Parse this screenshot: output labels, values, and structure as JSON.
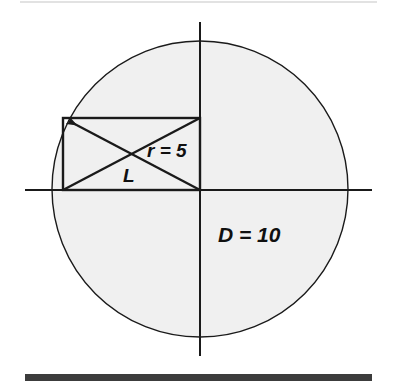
{
  "figure": {
    "type": "geometry-diagram",
    "canvas": {
      "width": 397,
      "height": 392,
      "background": "#ffffff"
    },
    "colors": {
      "circle_fill": "#f0f0f0",
      "stroke": "#1a1a1a",
      "axis": "#1a1a1a",
      "top_rule": "#e2e2e2",
      "bottom_bar": "#3c3c3c",
      "label": "#101010"
    },
    "circle": {
      "name": "main-circle",
      "center_x": 200,
      "center_y": 189,
      "radius": 148,
      "fill": "#f0f0f0",
      "stroke_width": 1.4
    },
    "axes": {
      "horizontal": {
        "y": 190,
        "x_start": 25,
        "x_end": 372,
        "stroke_width": 2
      },
      "vertical": {
        "x": 200,
        "y_start": 22,
        "y_end": 356,
        "stroke_width": 2
      }
    },
    "rectangle": {
      "name": "inscribed-rectangle",
      "left": 63,
      "top": 118,
      "right": 200,
      "bottom": 190,
      "width": 137,
      "height": 72,
      "stroke_width": 2.4
    },
    "diagonals": [
      {
        "name": "diagonal-radius",
        "from_x": 63,
        "from_y": 190,
        "to_x": 200,
        "to_y": 118,
        "arrow": false,
        "stroke_width": 2.4
      },
      {
        "name": "diagonal-arrow",
        "from_x": 200,
        "from_y": 190,
        "to_x": 63,
        "to_y": 118,
        "arrow": true,
        "stroke_width": 2.4
      }
    ],
    "labels": [
      {
        "id": "radius-label",
        "text": "r = 5",
        "x": 147,
        "y": 157
      },
      {
        "id": "length-label",
        "text": "L",
        "x": 123,
        "y": 182
      },
      {
        "id": "diameter-label",
        "text": "D = 10",
        "x": 218,
        "y": 242
      }
    ],
    "rules": {
      "top_rule": {
        "y": 2,
        "x_start": 20,
        "x_end": 377,
        "thickness": 2
      },
      "bottom_bar": {
        "y": 374,
        "x_start": 25,
        "x_end": 372,
        "thickness": 7
      }
    }
  }
}
